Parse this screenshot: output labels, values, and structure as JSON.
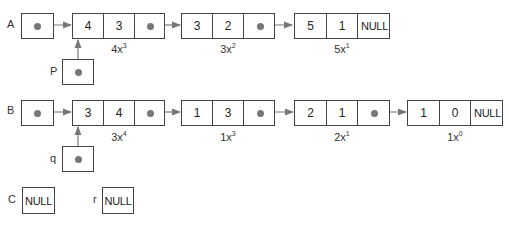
{
  "lists": {
    "A": {
      "label": "A",
      "nodes": [
        {
          "coef": "4",
          "exp": "3",
          "next": "pointer",
          "term": "4x",
          "term_exp": "3"
        },
        {
          "coef": "3",
          "exp": "2",
          "next": "pointer",
          "term": "3x",
          "term_exp": "2"
        },
        {
          "coef": "5",
          "exp": "1",
          "next": "NULL",
          "term": "5x",
          "term_exp": "1"
        }
      ]
    },
    "B": {
      "label": "B",
      "nodes": [
        {
          "coef": "3",
          "exp": "4",
          "next": "pointer",
          "term": "3x",
          "term_exp": "4"
        },
        {
          "coef": "1",
          "exp": "3",
          "next": "pointer",
          "term": "1x",
          "term_exp": "3"
        },
        {
          "coef": "2",
          "exp": "1",
          "next": "pointer",
          "term": "2x",
          "term_exp": "1"
        },
        {
          "coef": "1",
          "exp": "0",
          "next": "NULL",
          "term": "1x",
          "term_exp": "0"
        }
      ]
    }
  },
  "pointers": {
    "p": {
      "label": "P",
      "points_to": "A.node0"
    },
    "q": {
      "label": "q",
      "points_to": "B.node0"
    },
    "C": {
      "label": "C",
      "value": "NULL"
    },
    "r": {
      "label": "r",
      "value": "NULL"
    }
  },
  "colors": {
    "line": "#444444",
    "arrow": "#777777"
  }
}
